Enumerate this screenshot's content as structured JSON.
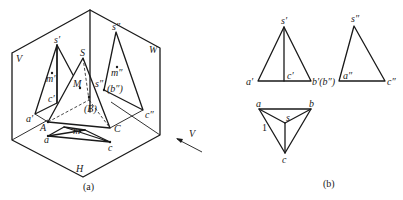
{
  "figure_a": {
    "caption": "(a)",
    "plane_labels": {
      "v": "V",
      "w": "W",
      "h": "H"
    },
    "view_arrow_label": "V",
    "space_points": {
      "apex": "S",
      "a": "A",
      "b": "(B)",
      "c": "C",
      "m": "M"
    },
    "v_projection": {
      "apex": "s′",
      "a": "a′",
      "c": "c′",
      "m": "m′"
    },
    "w_projection": {
      "apex": "s″",
      "s_side": "s″",
      "b": "(b″)",
      "c": "c″",
      "m": "m″"
    },
    "h_projection": {
      "a": "a",
      "c": "c",
      "m": "m"
    }
  },
  "figure_b": {
    "caption": "(b)",
    "front_view": {
      "apex": "s′",
      "a": "a′",
      "c": "c′",
      "b": "b′(b″)"
    },
    "side_view": {
      "apex": "s″",
      "a": "a″",
      "c": "c″"
    },
    "top_view": {
      "a": "a",
      "b": "b",
      "s": "s",
      "c": "c",
      "edge_mark": "1"
    }
  }
}
